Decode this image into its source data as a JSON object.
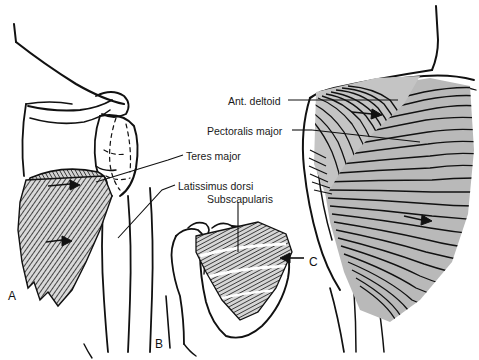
{
  "figure": {
    "background_color": "#ffffff",
    "ink_color": "#111111",
    "shade_color": "#b3b3b3",
    "width": 479,
    "height": 360
  },
  "labels": [
    {
      "id": "ant-deltoid",
      "text": "Ant. deltoid",
      "x": 228,
      "y": 96
    },
    {
      "id": "pectoralis-major",
      "text": "Pectoralis major",
      "x": 207,
      "y": 126
    },
    {
      "id": "teres-major",
      "text": "Teres major",
      "x": 186,
      "y": 151
    },
    {
      "id": "latissimus-dorsi",
      "text": "Latissimus dorsi",
      "x": 178,
      "y": 181
    },
    {
      "id": "subscapularis",
      "text": "Subscapularis",
      "x": 207,
      "y": 194
    }
  ],
  "panels": [
    {
      "id": "panel-a",
      "letter": "A",
      "x": 8,
      "y": 290,
      "description": "Anterior view of shoulder girdle with latissimus dorsi and teres major fan"
    },
    {
      "id": "panel-b",
      "letter": "B",
      "x": 155,
      "y": 338,
      "description": "Scapula anterior surface showing subscapularis fiber arrangement"
    },
    {
      "id": "panel-c",
      "letter": "C",
      "x": 309,
      "y": 256,
      "description": "Anterior chest wall showing deltoid and pectoralis major fibers"
    }
  ],
  "leaders": [
    {
      "id": "leader-ant-deltoid",
      "from_label": "Ant. deltoid",
      "to_panel": "C"
    },
    {
      "id": "leader-pectoralis-major",
      "from_label": "Pectoralis major",
      "to_panel": "C"
    },
    {
      "id": "leader-teres-major",
      "from_label": "Teres major",
      "to_panel": "A"
    },
    {
      "id": "leader-latissimus-dorsi",
      "from_label": "Latissimus dorsi",
      "to_panel": "A"
    },
    {
      "id": "leader-subscapularis",
      "from_label": "Subscapularis",
      "to_panel": "B"
    }
  ],
  "markers": [
    {
      "id": "arrow-panel-a-upper",
      "kind": "direction-arrow",
      "panel": "A"
    },
    {
      "id": "arrow-panel-a-lower",
      "kind": "direction-arrow",
      "panel": "A"
    },
    {
      "id": "arrow-panel-b-right",
      "kind": "direction-arrow",
      "panel": "B"
    },
    {
      "id": "arrow-panel-c-upper",
      "kind": "direction-arrow",
      "panel": "C"
    },
    {
      "id": "arrow-panel-c-lower",
      "kind": "direction-arrow",
      "panel": "C"
    }
  ]
}
